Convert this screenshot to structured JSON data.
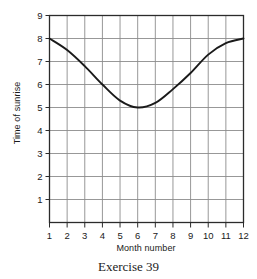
{
  "chart_data": {
    "type": "line",
    "title": "",
    "caption": "Exercise 39",
    "xlabel": "Month number",
    "ylabel": "Time of sunrise",
    "xlim": [
      1,
      12
    ],
    "ylim": [
      0,
      9
    ],
    "grid": true,
    "legend": null,
    "x_ticks": [
      "1",
      "2",
      "3",
      "4",
      "5",
      "6",
      "7",
      "8",
      "9",
      "10",
      "11",
      "12"
    ],
    "y_ticks": [
      "1",
      "2",
      "3",
      "4",
      "5",
      "6",
      "7",
      "8",
      "9"
    ],
    "series": [
      {
        "name": "Time of sunrise",
        "color": "#1a1a1a",
        "x": [
          1,
          2,
          3,
          4,
          5,
          6,
          7,
          8,
          9,
          10,
          11,
          12
        ],
        "values": [
          8.0,
          7.5,
          6.8,
          6.0,
          5.3,
          5.0,
          5.2,
          5.8,
          6.5,
          7.3,
          7.8,
          8.0
        ]
      }
    ],
    "annotations": {
      "minimum_month": 6,
      "minimum_value": 5,
      "endpoint_value": 8
    }
  },
  "colors": {
    "curve": "#1a1a1a",
    "grid": "#8c8c8c",
    "frame": "#2b2b2b",
    "text": "#1a1a1a",
    "background": "#ffffff"
  }
}
